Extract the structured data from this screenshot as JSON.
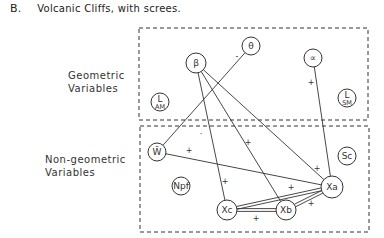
{
  "title": {
    "label": "B.",
    "text": "Volcanic Cliffs, with screes."
  },
  "groups": [
    {
      "id": "geometric",
      "line1": "Geometric",
      "line2": "Variables",
      "box": {
        "x": 139,
        "y": 28,
        "w": 229,
        "h": 92
      }
    },
    {
      "id": "non-geometric",
      "line1": "Non-geometric",
      "line2": "Variables",
      "box": {
        "x": 140,
        "y": 126,
        "w": 229,
        "h": 106
      }
    }
  ],
  "nodes": [
    {
      "id": "theta",
      "label": "θ",
      "x": 251,
      "y": 46,
      "r": 9
    },
    {
      "id": "beta",
      "label": "β",
      "x": 196,
      "y": 63,
      "r": 10
    },
    {
      "id": "alpha",
      "label": "∝",
      "x": 313,
      "y": 58,
      "r": 9
    },
    {
      "id": "LAM",
      "label": "L",
      "sub": "AM",
      "x": 160,
      "y": 102,
      "r": 9
    },
    {
      "id": "LSM",
      "label": "L",
      "sub": "SM",
      "x": 347,
      "y": 98,
      "r": 9
    },
    {
      "id": "W",
      "label": "W̄",
      "x": 157,
      "y": 152,
      "r": 9
    },
    {
      "id": "Sc",
      "label": "Sc",
      "x": 347,
      "y": 156,
      "r": 9
    },
    {
      "id": "Npf",
      "label": "Npf",
      "x": 181,
      "y": 186,
      "r": 9
    },
    {
      "id": "Xa",
      "label": "Xa",
      "x": 332,
      "y": 187,
      "r": 11
    },
    {
      "id": "Xc",
      "label": "Xc",
      "x": 227,
      "y": 210,
      "r": 10
    },
    {
      "id": "Xb",
      "label": "Xb",
      "x": 286,
      "y": 210,
      "r": 10
    }
  ],
  "edges": [
    {
      "from": "theta",
      "to": "W",
      "sign": "-",
      "sx": 237,
      "sy": 56,
      "style": "single"
    },
    {
      "from": "beta",
      "to": "Xc",
      "sign": "+",
      "sx": 225,
      "sy": 181,
      "style": "single"
    },
    {
      "from": "beta",
      "to": "Xb",
      "sign": "+",
      "sx": 248,
      "sy": 142,
      "style": "single"
    },
    {
      "from": "beta",
      "to": "Xa",
      "sign": "+",
      "sx": 317,
      "sy": 168,
      "style": "single"
    },
    {
      "from": "alpha",
      "to": "Xa",
      "sign": "+",
      "sx": 311,
      "sy": 82,
      "style": "single"
    },
    {
      "from": "W",
      "to": "Xa",
      "sign": "+",
      "sx": 189,
      "sy": 150,
      "style": "single"
    },
    {
      "from": "Xc",
      "to": "Xa",
      "sign": "+",
      "sx": 291,
      "sy": 187,
      "style": "double"
    },
    {
      "from": "Xc",
      "to": "Xb",
      "sign": "+",
      "sx": 256,
      "sy": 218,
      "style": "double"
    },
    {
      "from": "Xb",
      "to": "Xa",
      "sign": "+",
      "sx": 311,
      "sy": 203,
      "style": "double"
    }
  ],
  "annotations": [
    {
      "text": "·",
      "x": 201,
      "y": 134
    }
  ]
}
